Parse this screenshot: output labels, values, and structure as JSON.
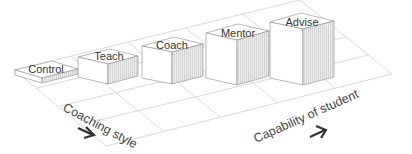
{
  "diagram": {
    "type": "isometric-bar-diagram",
    "bars": [
      {
        "label": "Control",
        "height": 1
      },
      {
        "label": "Teach",
        "height": 2
      },
      {
        "label": "Coach",
        "height": 3
      },
      {
        "label": "Mentor",
        "height": 4
      },
      {
        "label": "Advise",
        "height": 5
      }
    ],
    "axes": {
      "x_label": "Coaching style",
      "y_label": "Capability of student"
    },
    "icons": {
      "x_arrow": "arrow-right-icon",
      "y_arrow": "arrow-up-right-icon"
    },
    "colors": {
      "grid": "#cfcfcf",
      "edge": "#9a9a9a",
      "side_fill": "#e6e6e6",
      "text": "#333333"
    }
  }
}
